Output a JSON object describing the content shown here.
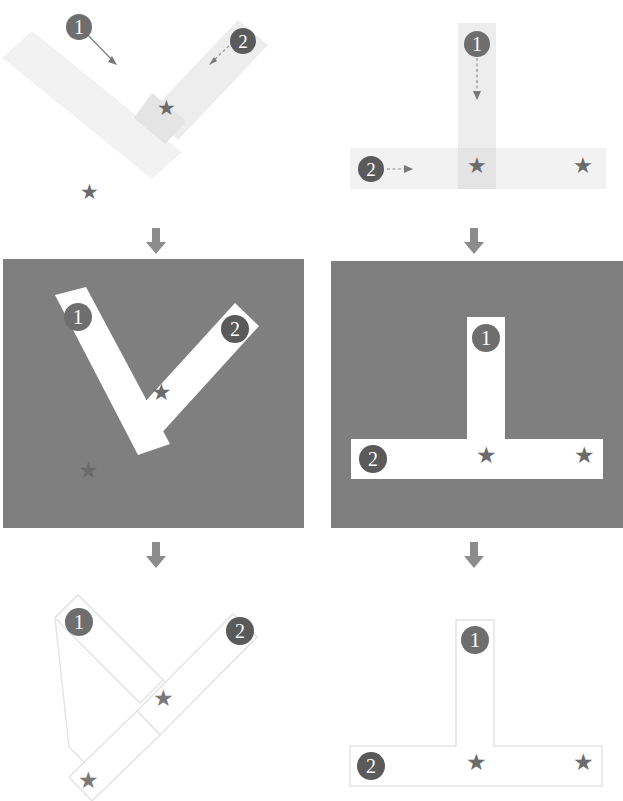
{
  "figure": {
    "title": "",
    "columns": [
      {
        "id": "left",
        "shape_name": "Y-junction"
      },
      {
        "id": "right",
        "shape_name": "T-junction"
      }
    ],
    "rows": [
      {
        "id": "row-stimulus",
        "description": "faint stripes with motion arrows"
      },
      {
        "id": "row-figure",
        "description": "white shape on dark gray background"
      },
      {
        "id": "row-outline",
        "description": "outline only shape on white"
      }
    ]
  },
  "labels": {
    "badge_one": "1",
    "badge_two": "2",
    "star_glyph": "★",
    "separator_arrow": "↓"
  },
  "colors": {
    "panel_background": "#7f7f7f",
    "stripe_faint": "#f2f2f2",
    "stripe_overlap": "#e4e4e4",
    "stripe_white": "#ffffff",
    "badge_fill": "#6e6e6e",
    "badge_text": "#ffffff",
    "star_fill": "#6b6b6b",
    "outline_stroke": "#e3e3e3",
    "arrow_stroke": "#787878"
  },
  "panels": {
    "top_left": {
      "name": "stimulus-y-junction",
      "badges": [
        {
          "label": "1",
          "arrow": "solid",
          "direction": "down-right"
        },
        {
          "label": "2",
          "arrow": "dashed",
          "direction": "down-left"
        }
      ],
      "stars": 2
    },
    "top_right": {
      "name": "stimulus-t-junction",
      "badges": [
        {
          "label": "1",
          "arrow": "dashed",
          "direction": "down"
        },
        {
          "label": "2",
          "arrow": "dashed",
          "direction": "right"
        }
      ],
      "stars": 2
    },
    "mid_left": {
      "name": "figure-y-junction",
      "badges": [
        {
          "label": "1"
        },
        {
          "label": "2"
        }
      ],
      "stars": 2
    },
    "mid_right": {
      "name": "figure-t-junction",
      "badges": [
        {
          "label": "1"
        },
        {
          "label": "2"
        }
      ],
      "stars": 2
    },
    "bottom_left": {
      "name": "outline-y-junction",
      "badges": [
        {
          "label": "1"
        },
        {
          "label": "2"
        }
      ],
      "stars": 2
    },
    "bottom_right": {
      "name": "outline-t-junction",
      "badges": [
        {
          "label": "1"
        },
        {
          "label": "2"
        }
      ],
      "stars": 2
    }
  }
}
